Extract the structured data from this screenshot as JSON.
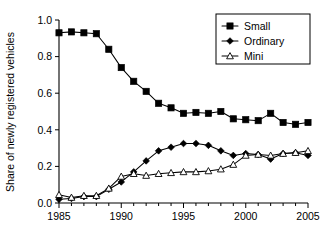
{
  "chart_data": {
    "type": "line",
    "title": "",
    "xlabel": "",
    "ylabel": "Share of newly registered vehicles",
    "xlim": [
      1985,
      2005
    ],
    "ylim": [
      0.0,
      1.0
    ],
    "grid": false,
    "legend_position": "top-right",
    "x_tick_labels": [
      "1985",
      "1990",
      "1995",
      "2000",
      "2005"
    ],
    "x_tick_values": [
      1985,
      1990,
      1995,
      2000,
      2005
    ],
    "x_minor_tick_values": [
      1986,
      1987,
      1988,
      1989,
      1991,
      1992,
      1993,
      1994,
      1996,
      1997,
      1998,
      1999,
      2001,
      2002,
      2003,
      2004
    ],
    "y_tick_labels": [
      "0.0",
      "0.2",
      "0.4",
      "0.6",
      "0.8",
      "1.0"
    ],
    "y_tick_values": [
      0.0,
      0.2,
      0.4,
      0.6,
      0.8,
      1.0
    ],
    "x": [
      1985,
      1986,
      1987,
      1988,
      1989,
      1990,
      1991,
      1992,
      1993,
      1994,
      1995,
      1996,
      1997,
      1998,
      1999,
      2000,
      2001,
      2002,
      2003,
      2004,
      2005
    ],
    "series": [
      {
        "name": "Small",
        "marker": "filled-square",
        "values": [
          0.93,
          0.935,
          0.93,
          0.925,
          0.84,
          0.74,
          0.665,
          0.61,
          0.545,
          0.52,
          0.49,
          0.495,
          0.49,
          0.5,
          0.46,
          0.455,
          0.45,
          0.49,
          0.44,
          0.43,
          0.44
        ]
      },
      {
        "name": "Ordinary",
        "marker": "filled-diamond",
        "values": [
          0.02,
          0.025,
          0.035,
          0.035,
          0.075,
          0.115,
          0.17,
          0.23,
          0.285,
          0.305,
          0.325,
          0.325,
          0.315,
          0.285,
          0.26,
          0.27,
          0.265,
          0.24,
          0.27,
          0.275,
          0.26
        ]
      },
      {
        "name": "Mini",
        "marker": "open-triangle",
        "values": [
          0.045,
          0.03,
          0.04,
          0.04,
          0.08,
          0.145,
          0.16,
          0.15,
          0.16,
          0.165,
          0.17,
          0.17,
          0.175,
          0.185,
          0.21,
          0.26,
          0.265,
          0.26,
          0.27,
          0.275,
          0.285
        ]
      }
    ]
  },
  "legend": {
    "entries": [
      {
        "label": "Small"
      },
      {
        "label": "Ordinary"
      },
      {
        "label": "Mini"
      }
    ]
  }
}
